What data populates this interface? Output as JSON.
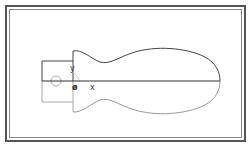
{
  "diagram": {
    "type": "technical drawing / tool handle profile",
    "labels": {
      "y_axis": "y",
      "origin": "ø",
      "x_axis": "x"
    },
    "colors": {
      "frame": "#555555",
      "upper_profile": "#444444",
      "lower_profile": "#999999",
      "axis": "#333333"
    }
  }
}
